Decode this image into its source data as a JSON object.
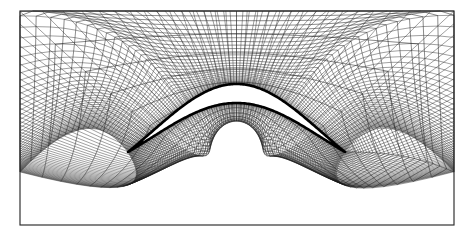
{
  "figure": {
    "kind": "cfd-structured-mesh",
    "canvas": {
      "width": 472,
      "height": 239,
      "background": "#ffffff"
    },
    "frame": {
      "x": 20.0,
      "y": 11.0,
      "width": 434.0,
      "height": 214.0,
      "stroke_color": "#2b2b2b",
      "stroke_width": 1.15
    },
    "mesh_style": {
      "line_color": "#1a1a1a",
      "line_width_min": 0.34,
      "line_width_max": 0.52,
      "airfoil_color": "#000000",
      "airfoil_outline_width": 2.6
    }
  },
  "chart_data": {
    "type": "mesh",
    "title": "",
    "xlabel": "",
    "ylabel": "",
    "grid": true,
    "legend": null,
    "domain": {
      "x_min": 20.0,
      "x_max": 454.0,
      "y_min": 11.0,
      "y_max": 225.0
    },
    "airfoil": {
      "name": "circular-arc blade",
      "leading_edge": [
        128.0,
        152.0
      ],
      "trailing_edge": [
        345.0,
        152.0
      ],
      "chord": 217.0,
      "mid_x": 236.5,
      "upper_apex_y": 84.0,
      "lower_apex_y": 103.0,
      "camber_height": 68.0,
      "max_thickness": 19.0,
      "surface_points_per_side": 160
    },
    "grid_topology": {
      "scheme": "o-grid-wrapped",
      "streamwise_cells": 120,
      "normal_cells": 34,
      "normal_stretch_exponent": 2.35,
      "wake_cluster_strength": 0.72,
      "far_field_blend_exponent": 1.45,
      "radial_lines_drawn": 121,
      "wrapping_lines_drawn": 35
    },
    "series": [
      {
        "name": "radial (normal) grid lines",
        "count": 121,
        "description": "lines emanating from airfoil surface outward to the rectangular far-field boundary"
      },
      {
        "name": "wrapping (tangential) grid lines",
        "count": 35,
        "description": "quasi-concentric contours wrapping the airfoil, clustered near the surface"
      },
      {
        "name": "airfoil surface",
        "count": 2,
        "description": "upper and lower circular-arc surfaces meeting at sharp leading and trailing edges"
      }
    ],
    "annotations": []
  }
}
